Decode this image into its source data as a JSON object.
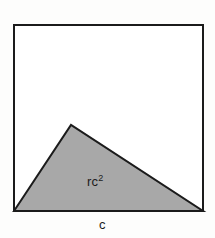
{
  "figure": {
    "background_color": "#fdfdfc",
    "square": {
      "name": "outer-square",
      "fill": "#ffffff",
      "stroke": "#1b1b1b",
      "stroke_width": 2,
      "x": 14,
      "y": 25,
      "width": 189,
      "height": 186
    },
    "triangle": {
      "name": "shaded-triangle",
      "fill": "#a8a8a8",
      "stroke": "#1b1b1b",
      "stroke_width": 2,
      "points": "14,211 71,125 203,211",
      "vertices": [
        {
          "x": 14,
          "y": 211
        },
        {
          "x": 71,
          "y": 125
        },
        {
          "x": 203,
          "y": 211
        }
      ]
    },
    "labels": {
      "area": {
        "base": "rc",
        "exponent": "2",
        "full": "rc2"
      },
      "base_side": "c"
    }
  }
}
